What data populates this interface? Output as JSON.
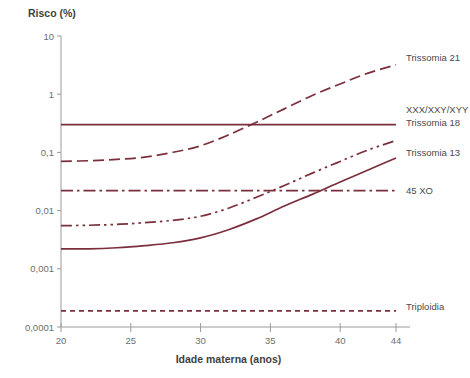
{
  "chart_data": {
    "type": "line",
    "title": "Risco (%)",
    "xlabel": "Idade materna (anos)",
    "ylabel": "Risco (%)",
    "yscale": "log",
    "ylim": [
      0.0001,
      10
    ],
    "xlim": [
      20,
      44
    ],
    "grid": false,
    "legend_position": "right-inline",
    "xticks": [
      "20",
      "25",
      "30",
      "35",
      "40",
      "44"
    ],
    "xtick_values": [
      20,
      25,
      30,
      35,
      40,
      44
    ],
    "yticks": [
      "10",
      "1",
      "0,1",
      "0,01",
      "0,001",
      "0,0001"
    ],
    "ytick_values": [
      10,
      1,
      0.1,
      0.01,
      0.001,
      0.0001
    ],
    "line_color": "#7b2f3c",
    "axis_color": "#9a9a9a",
    "series": [
      {
        "name": "Trissomia 21",
        "style": "dashed",
        "color": "#7b2f3c",
        "label_y_value": 3.0,
        "x": [
          20,
          22,
          24,
          26,
          28,
          30,
          32,
          34,
          35,
          36,
          38,
          40,
          42,
          44
        ],
        "values": [
          0.07,
          0.072,
          0.076,
          0.083,
          0.1,
          0.13,
          0.2,
          0.33,
          0.43,
          0.56,
          0.95,
          1.5,
          2.3,
          3.2
        ]
      },
      {
        "name": "XXX/XXY/XYY",
        "style": "solid",
        "color": "#7b2f3c",
        "label_y_value": 0.3,
        "x": [
          20,
          44
        ],
        "values": [
          0.3,
          0.3
        ]
      },
      {
        "name": "Trissomia 18",
        "style": "dash-dot-dot",
        "color": "#7b2f3c",
        "label_y_value": 0.26,
        "x": [
          20,
          22,
          24,
          26,
          28,
          30,
          32,
          34,
          36,
          38,
          40,
          42,
          44
        ],
        "values": [
          0.0055,
          0.0056,
          0.0058,
          0.0062,
          0.0068,
          0.008,
          0.011,
          0.017,
          0.027,
          0.044,
          0.07,
          0.11,
          0.16
        ]
      },
      {
        "name": "Trissomia 13",
        "style": "solid",
        "color": "#7b2f3c",
        "label_y_value": 0.1,
        "x": [
          20,
          22,
          24,
          26,
          28,
          30,
          32,
          34,
          36,
          38,
          40,
          42,
          44
        ],
        "values": [
          0.0022,
          0.0022,
          0.0023,
          0.0025,
          0.0028,
          0.0034,
          0.0047,
          0.0072,
          0.012,
          0.019,
          0.031,
          0.05,
          0.08
        ]
      },
      {
        "name": "45 XO",
        "style": "dash-dot",
        "color": "#7b2f3c",
        "label_y_value": 0.022,
        "x": [
          20,
          44
        ],
        "values": [
          0.022,
          0.022
        ]
      },
      {
        "name": "Triploidia",
        "style": "short-dashed",
        "color": "#7b2f3c",
        "label_y_value": 0.00019,
        "x": [
          20,
          44
        ],
        "values": [
          0.00019,
          0.00019
        ]
      }
    ]
  }
}
